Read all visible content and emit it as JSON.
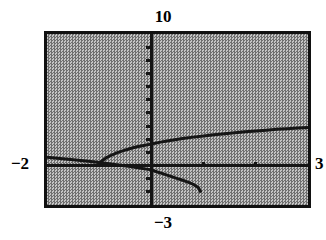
{
  "figure": {
    "kind": "graphing-calculator-plot",
    "background_color": "#9a9a9a",
    "frame_color": "#111111",
    "curve_color": "#151515"
  },
  "labels": {
    "y_max": "10",
    "y_min": "−3",
    "x_min": "−2",
    "x_max": "3"
  },
  "chart_data": {
    "type": "line",
    "title": "",
    "xlabel": "",
    "ylabel": "",
    "xlim": [
      -2,
      3
    ],
    "ylim": [
      -3,
      10
    ],
    "grid": false,
    "legend": null,
    "axes": {
      "x_axis_y": 0,
      "y_axis_x": 0,
      "x_ticks": [
        -2,
        -1,
        0,
        1,
        2,
        3
      ],
      "y_ticks": [
        -3,
        -2,
        -1,
        0,
        1,
        2,
        3,
        4,
        5,
        6,
        7,
        8,
        9,
        10
      ],
      "tick_labels_shown": false
    },
    "series": [
      {
        "name": "upper-branch",
        "style": "solid",
        "x": [
          -1.05,
          -0.95,
          -0.85,
          -0.75,
          -0.65,
          -0.55,
          -0.45,
          -0.35,
          -0.25,
          -0.15,
          -0.05,
          0.0,
          0.15,
          0.3,
          0.45,
          0.6,
          0.8,
          1.0,
          1.2,
          1.4,
          1.6,
          1.8,
          2.0,
          2.2,
          2.4,
          2.6,
          2.8,
          3.0
        ],
        "y": [
          -0.05,
          0.35,
          0.62,
          0.82,
          0.98,
          1.12,
          1.24,
          1.35,
          1.45,
          1.53,
          1.6,
          1.64,
          1.76,
          1.87,
          1.96,
          2.05,
          2.16,
          2.25,
          2.34,
          2.42,
          2.5,
          2.57,
          2.63,
          2.69,
          2.75,
          2.8,
          2.85,
          2.9
        ]
      },
      {
        "name": "lower-left-branch",
        "style": "solid",
        "x": [
          -2.0,
          -1.8,
          -1.6,
          -1.4,
          -1.2,
          -1.0,
          -0.8,
          -0.6,
          -0.4,
          -0.2,
          0.0
        ],
        "y": [
          0.63,
          0.56,
          0.48,
          0.4,
          0.32,
          0.23,
          0.13,
          0.03,
          -0.08,
          -0.2,
          -0.33
        ]
      },
      {
        "name": "lower-right-branch",
        "style": "solid",
        "x": [
          0.0,
          0.1,
          0.2,
          0.3,
          0.4,
          0.5,
          0.6,
          0.7,
          0.8,
          0.9,
          0.95
        ],
        "y": [
          -0.33,
          -0.47,
          -0.6,
          -0.73,
          -0.86,
          -0.99,
          -1.12,
          -1.26,
          -1.42,
          -1.68,
          -2.05
        ]
      }
    ]
  }
}
